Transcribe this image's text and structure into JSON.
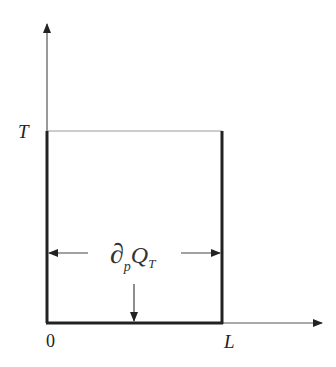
{
  "labels": {
    "y_top": "T",
    "x_origin": "0",
    "x_end": "L",
    "operator": "∂",
    "subscript_p": "p",
    "Q": "Q",
    "subscript_T": "T"
  },
  "colors": {
    "line": "#222222",
    "thin": "#777777"
  }
}
